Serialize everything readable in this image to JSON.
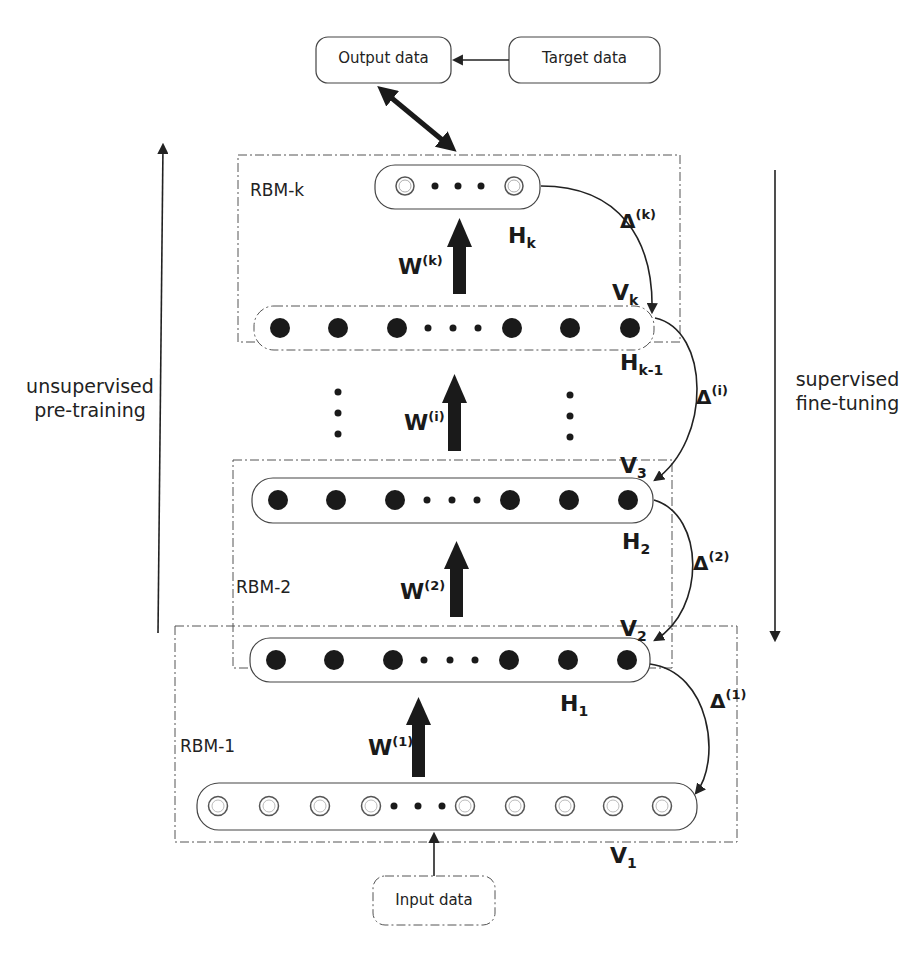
{
  "diagram": {
    "type": "stacked RBM / deep belief network training schematic",
    "boxes": {
      "output": "Output data",
      "target": "Target data",
      "input": "Input data"
    },
    "rbm_labels": {
      "rbm_k": "RBM-k",
      "rbm_2": "RBM-2",
      "rbm_1": "RBM-1"
    },
    "side_labels": {
      "left_line1": "unsupervised",
      "left_line2": "pre-training",
      "right_line1": "supervised",
      "right_line2": "fine-tuning"
    },
    "layers": {
      "hk": {
        "base": "H",
        "sub": "k"
      },
      "vk": {
        "base": "V",
        "sub": "k"
      },
      "hk1": {
        "base": "H",
        "sub": "k-1"
      },
      "v3": {
        "base": "V",
        "sub": "3"
      },
      "h2": {
        "base": "H",
        "sub": "2"
      },
      "v2": {
        "base": "V",
        "sub": "2"
      },
      "h1": {
        "base": "H",
        "sub": "1"
      },
      "v1": {
        "base": "V",
        "sub": "1"
      }
    },
    "weights": {
      "wk": {
        "base": "W",
        "sup": "(k)"
      },
      "wi": {
        "base": "W",
        "sup": "(i)"
      },
      "w2": {
        "base": "W",
        "sup": "(2)"
      },
      "w1": {
        "base": "W",
        "sup": "(1)"
      }
    },
    "deltas": {
      "dk": {
        "base": "Δ",
        "sup": "(k)"
      },
      "di": {
        "base": "Δ",
        "sup": "(i)"
      },
      "d2": {
        "base": "Δ",
        "sup": "(2)"
      },
      "d1": {
        "base": "Δ",
        "sup": "(1)"
      }
    },
    "ellipsis": "• • •",
    "colors": {
      "stroke": "#333333",
      "node_fill": "#1a1a1a",
      "open_node": "#ffffff"
    }
  }
}
